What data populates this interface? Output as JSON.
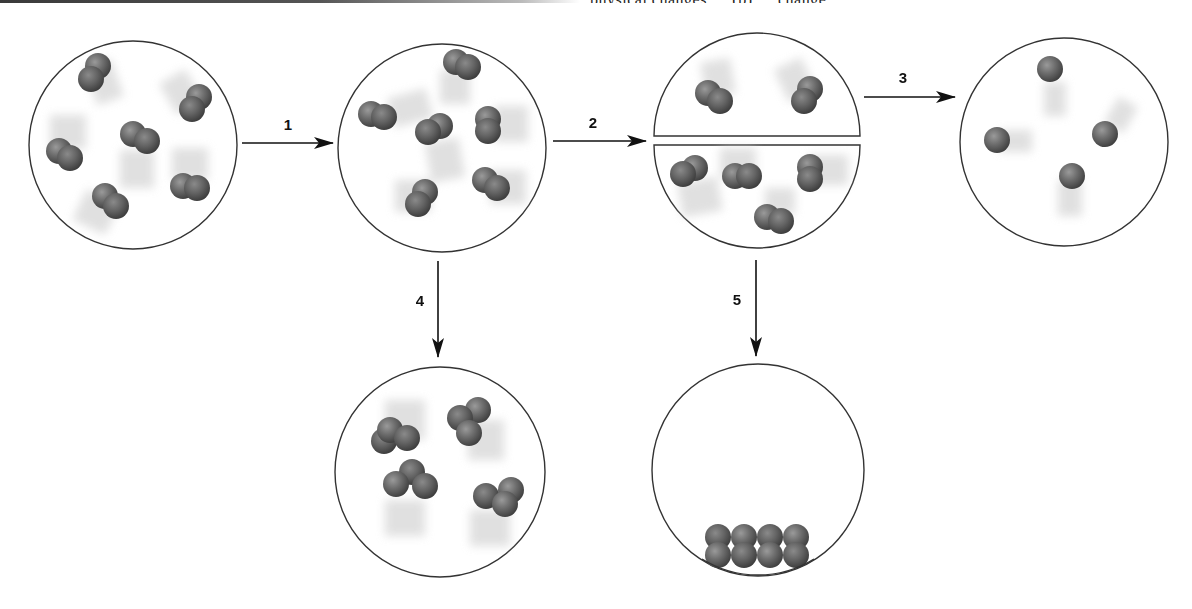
{
  "figure": {
    "top_fragment_text": "physical changes … (b) … change",
    "colors": {
      "outline": "#333333",
      "atom_dark": "#4a4a4a",
      "atom_mid": "#6e6e6e",
      "atom_light": "#9a9a9a",
      "motion_blur": "#d9d9d9",
      "arrow": "#111111"
    }
  },
  "steps": [
    {
      "id": 1,
      "label": "1",
      "from": "sample-initial",
      "to": "sample-after-1",
      "direction": "right"
    },
    {
      "id": 2,
      "label": "2",
      "from": "sample-after-1",
      "to": "sample-after-2",
      "direction": "right"
    },
    {
      "id": 3,
      "label": "3",
      "from": "sample-after-2",
      "to": "sample-after-3",
      "direction": "right"
    },
    {
      "id": 4,
      "label": "4",
      "from": "sample-after-1",
      "to": "sample-after-4",
      "direction": "down"
    },
    {
      "id": 5,
      "label": "5",
      "from": "sample-after-2",
      "to": "sample-after-5",
      "direction": "down"
    }
  ],
  "containers": [
    {
      "name": "sample-initial",
      "cx": 133,
      "cy": 145,
      "r": 104,
      "split": false,
      "particle_type": "diatomic",
      "particle_count": 6
    },
    {
      "name": "sample-after-1",
      "cx": 442,
      "cy": 148,
      "r": 104,
      "split": false,
      "particle_type": "diatomic",
      "particle_count": 6
    },
    {
      "name": "sample-after-2",
      "cx": 757,
      "cy": 140,
      "r": 104,
      "split": true,
      "top_half_count": 2,
      "bottom_half_count": 4,
      "particle_type": "diatomic",
      "particle_count": 6
    },
    {
      "name": "sample-after-3",
      "cx": 1064,
      "cy": 142,
      "r": 104,
      "split": false,
      "particle_type": "monatomic",
      "particle_count": 4
    },
    {
      "name": "sample-after-4",
      "cx": 440,
      "cy": 472,
      "r": 105,
      "split": false,
      "particle_type": "triatomic",
      "particle_count": 4
    },
    {
      "name": "sample-after-5",
      "cx": 758,
      "cy": 470,
      "r": 106,
      "split": false,
      "particle_type": "diatomic-condensed",
      "particle_count": 4
    }
  ]
}
